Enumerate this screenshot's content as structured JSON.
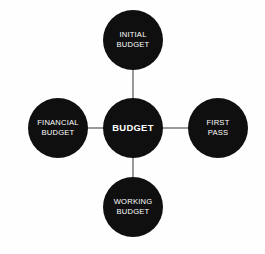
{
  "diagram": {
    "type": "hub-and-spoke",
    "background_color": "#fefefe",
    "node_color": "#100f0f",
    "node_text_color": "#ffffff",
    "connector_color": "#9a9a9a",
    "hub": {
      "id": "budget",
      "label": "BUDGET",
      "lines": [
        "BUDGET"
      ],
      "emphasis": "bold"
    },
    "satellites": [
      {
        "id": "initial-budget",
        "position": "top",
        "label": "INITIAL BUDGET",
        "lines": [
          "INITIAL",
          "BUDGET"
        ]
      },
      {
        "id": "financial-budget",
        "position": "left",
        "label": "FINANCIAL BUDGET",
        "lines": [
          "FINANCIAL",
          "BUDGET"
        ]
      },
      {
        "id": "first-pass",
        "position": "right",
        "label": "FIRST PASS",
        "lines": [
          "FIRST",
          "PASS"
        ]
      },
      {
        "id": "working-budget",
        "position": "bottom",
        "label": "WORKING BUDGET",
        "lines": [
          "WORKING",
          "BUDGET"
        ]
      }
    ],
    "connections": [
      {
        "from": "budget",
        "to": "initial-budget"
      },
      {
        "from": "budget",
        "to": "financial-budget"
      },
      {
        "from": "budget",
        "to": "first-pass"
      },
      {
        "from": "budget",
        "to": "working-budget"
      }
    ]
  }
}
